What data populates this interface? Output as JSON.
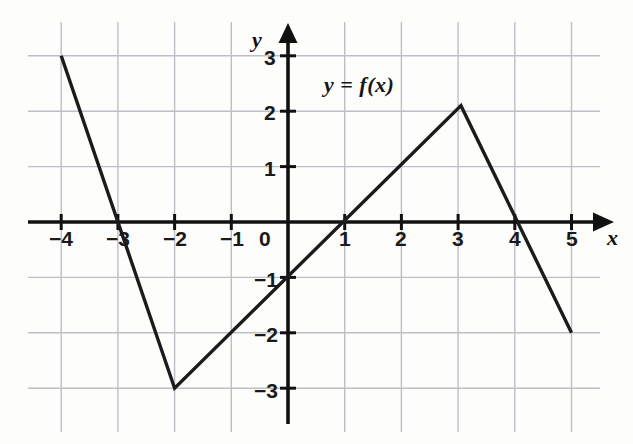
{
  "chart_data": {
    "type": "line",
    "title": "",
    "curve_label": "y = f(x)",
    "xlabel": "x",
    "ylabel": "y",
    "xlim": [
      -4.8,
      5.45
    ],
    "ylim": [
      -3.55,
      3.55
    ],
    "grid": true,
    "grid_color": "#b9bcc4",
    "axis_color": "#111111",
    "curve_color": "#1b1b1b",
    "legend": "none",
    "x_ticks": [
      -4,
      -3,
      -2,
      -1,
      0,
      1,
      2,
      3,
      4,
      5
    ],
    "y_ticks": [
      3,
      2,
      1,
      -1,
      -2,
      -3
    ],
    "x_tick_labels": [
      "−4",
      "−3",
      "−2",
      "−1",
      "0",
      "1",
      "2",
      "3",
      "4",
      "5"
    ],
    "y_tick_labels": [
      "3",
      "2",
      "1",
      "−1",
      "−2",
      "−3"
    ],
    "series": [
      {
        "name": "f(x)",
        "points": [
          {
            "x": -4.0,
            "y": 3.0
          },
          {
            "x": -2.0,
            "y": -3.0
          },
          {
            "x": 3.05,
            "y": 2.1
          },
          {
            "x": 5.0,
            "y": -2.0
          }
        ]
      }
    ],
    "annotations": [
      {
        "text": "y = f(x)",
        "x": 0.7,
        "y": 2.65
      }
    ],
    "notes": {
      "x_intercepts": [
        -3.05,
        1.1,
        4.15
      ],
      "y_intercept": -1.0,
      "minimum": {
        "x": -2.0,
        "y": -3.0
      },
      "maximum": {
        "x": 3.05,
        "y": 2.1
      }
    }
  },
  "axes": {
    "x_axis_name": "x",
    "y_axis_name": "y"
  }
}
